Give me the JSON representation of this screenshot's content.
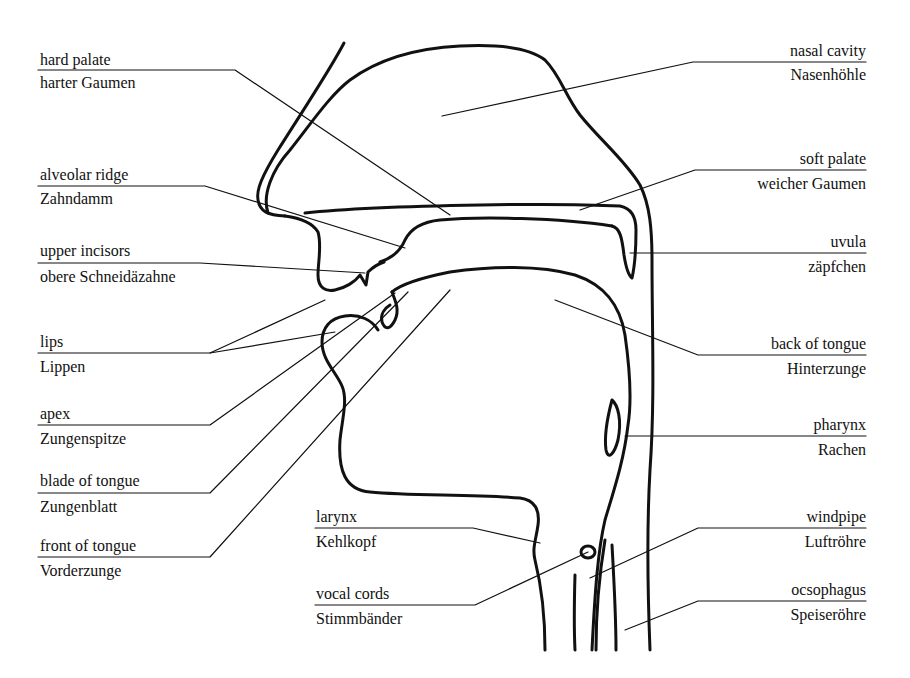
{
  "diagram": {
    "title": "",
    "stroke_color": "#111111",
    "background": "#ffffff",
    "labels_left": [
      {
        "id": "hard-palate",
        "en": "hard palate",
        "de": "harter Gaumen"
      },
      {
        "id": "alveolar-ridge",
        "en": "alveolar ridge",
        "de": "Zahndamm"
      },
      {
        "id": "upper-incisors",
        "en": "upper incisors",
        "de": "obere Schneidäzahne"
      },
      {
        "id": "lips",
        "en": "lips",
        "de": "Lippen"
      },
      {
        "id": "apex",
        "en": "apex",
        "de": "Zungenspitze"
      },
      {
        "id": "blade-of-tongue",
        "en": "blade of tongue",
        "de": "Zungenblatt"
      },
      {
        "id": "front-of-tongue",
        "en": "front of tongue",
        "de": "Vorderzunge"
      }
    ],
    "labels_center": [
      {
        "id": "larynx",
        "en": "larynx",
        "de": "Kehlkopf"
      },
      {
        "id": "vocal-cords",
        "en": "vocal cords",
        "de": "Stimmbänder"
      }
    ],
    "labels_right": [
      {
        "id": "nasal-cavity",
        "en": "nasal cavity",
        "de": "Nasenhöhle"
      },
      {
        "id": "soft-palate",
        "en": "soft palate",
        "de": "weicher Gaumen"
      },
      {
        "id": "uvula",
        "en": "uvula",
        "de": "zäpfchen"
      },
      {
        "id": "back-of-tongue",
        "en": "back of tongue",
        "de": "Hinterzunge"
      },
      {
        "id": "pharynx",
        "en": "pharynx",
        "de": "Rachen"
      },
      {
        "id": "windpipe",
        "en": "windpipe",
        "de": "Luftröhre"
      },
      {
        "id": "oesophagus",
        "en": "ocsophagus",
        "de": "Speiseröhre"
      }
    ]
  }
}
